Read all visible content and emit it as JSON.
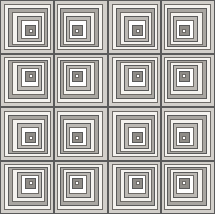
{
  "artwork": {
    "title": "Log Cabin Quilt Pattern",
    "type": "geometric-tiling",
    "canvas": {
      "width": 215,
      "height": 214,
      "background": "#ffffff"
    },
    "grid": {
      "rows": 4,
      "cols": 4,
      "total_blocks": 16
    },
    "border": {
      "color": "#5a5a5a",
      "width": 1
    }
  },
  "palette": {
    "white": "#ffffff",
    "cream": "#f4f2ee",
    "light_gray": "#e3e1dd",
    "mid_light_gray": "#d2cfca",
    "mid_gray": "#bcb9b4",
    "gray": "#a9a6a1",
    "dark_gray": "#8f8c87",
    "outline": "#5a5a5a",
    "thin_line": "#6e6b67"
  },
  "block_rings": [
    {
      "index": 0,
      "inset_pct": 0,
      "fill": "#d2cfca",
      "stroke": "#5a5a5a",
      "label": "ring-outer-1"
    },
    {
      "index": 1,
      "inset_pct": 7.0,
      "fill": "#f4f2ee",
      "stroke": "#6e6b67",
      "label": "ring-2"
    },
    {
      "index": 2,
      "inset_pct": 13.5,
      "fill": "#a9a6a1",
      "stroke": "#5a5a5a",
      "label": "ring-3"
    },
    {
      "index": 3,
      "inset_pct": 20.0,
      "fill": "#f4f2ee",
      "stroke": "#6e6b67",
      "label": "ring-4"
    },
    {
      "index": 4,
      "inset_pct": 26.5,
      "fill": "#bcb9b4",
      "stroke": "#5a5a5a",
      "label": "ring-5"
    },
    {
      "index": 5,
      "inset_pct": 33.0,
      "fill": "#ffffff",
      "stroke": "#6e6b67",
      "label": "ring-6"
    },
    {
      "index": 6,
      "inset_pct": 39.5,
      "fill": "#8f8c87",
      "stroke": "#5a5a5a",
      "label": "ring-7"
    },
    {
      "index": 7,
      "inset_pct": 46.0,
      "fill": "#ffffff",
      "stroke": "#6e6b67",
      "label": "ring-center"
    }
  ],
  "blocks": [
    {
      "id": "block-r0-c0",
      "row": 0,
      "col": 0,
      "orientation": "tl"
    },
    {
      "id": "block-r0-c1",
      "row": 0,
      "col": 1,
      "orientation": "tr"
    },
    {
      "id": "block-r0-c2",
      "row": 0,
      "col": 2,
      "orientation": "tl"
    },
    {
      "id": "block-r0-c3",
      "row": 0,
      "col": 3,
      "orientation": "tr"
    },
    {
      "id": "block-r1-c0",
      "row": 1,
      "col": 0,
      "orientation": "bl"
    },
    {
      "id": "block-r1-c1",
      "row": 1,
      "col": 1,
      "orientation": "br"
    },
    {
      "id": "block-r1-c2",
      "row": 1,
      "col": 2,
      "orientation": "bl"
    },
    {
      "id": "block-r1-c3",
      "row": 1,
      "col": 3,
      "orientation": "br"
    },
    {
      "id": "block-r2-c0",
      "row": 2,
      "col": 0,
      "orientation": "tl"
    },
    {
      "id": "block-r2-c1",
      "row": 2,
      "col": 1,
      "orientation": "tr"
    },
    {
      "id": "block-r2-c2",
      "row": 2,
      "col": 2,
      "orientation": "tl"
    },
    {
      "id": "block-r2-c3",
      "row": 2,
      "col": 3,
      "orientation": "tr"
    },
    {
      "id": "block-r3-c0",
      "row": 3,
      "col": 0,
      "orientation": "bl"
    },
    {
      "id": "block-r3-c1",
      "row": 3,
      "col": 1,
      "orientation": "br"
    },
    {
      "id": "block-r3-c2",
      "row": 3,
      "col": 2,
      "orientation": "bl"
    },
    {
      "id": "block-r3-c3",
      "row": 3,
      "col": 3,
      "orientation": "br"
    }
  ]
}
